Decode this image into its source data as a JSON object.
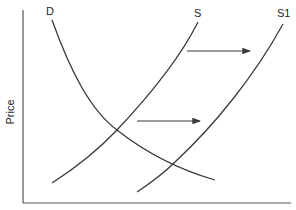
{
  "diagram": {
    "type": "supply-demand shift",
    "y_axis_label": "Price",
    "x_axis_label": "",
    "curves": [
      {
        "label": "D",
        "kind": "demand"
      },
      {
        "label": "S",
        "kind": "supply"
      },
      {
        "label": "S1",
        "kind": "supply-shifted"
      }
    ],
    "arrows": [
      {
        "direction": "right",
        "meaning": "supply shift"
      },
      {
        "direction": "right",
        "meaning": "supply shift"
      }
    ],
    "colors": {
      "line": "#3a3a3a",
      "axis": "#555555",
      "background": "#ffffff"
    }
  }
}
